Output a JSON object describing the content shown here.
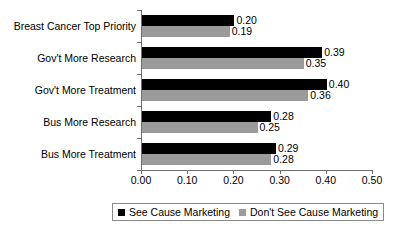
{
  "chart_data": {
    "type": "bar",
    "orientation": "horizontal",
    "title": "",
    "xlabel": "",
    "ylabel": "",
    "xlim": [
      0.0,
      0.5
    ],
    "xticks": [
      "0.00",
      "0.10",
      "0.20",
      "0.30",
      "0.40",
      "0.50"
    ],
    "xtick_values": [
      0.0,
      0.1,
      0.2,
      0.3,
      0.4,
      0.5
    ],
    "grid": false,
    "legend_position": "bottom",
    "categories": [
      "Breast Cancer Top Priority",
      "Gov't More Research",
      "Gov't More Treatment",
      "Bus More Research",
      "Bus More Treatment"
    ],
    "series": [
      {
        "name": "See Cause Marketing",
        "color": "#000000",
        "values": [
          0.2,
          0.39,
          0.4,
          0.28,
          0.29
        ],
        "labels": [
          "0.20",
          "0.39",
          "0.40",
          "0.28",
          "0.29"
        ]
      },
      {
        "name": "Don't See Cause Marketing",
        "color": "#9b9b9b",
        "values": [
          0.19,
          0.35,
          0.36,
          0.25,
          0.28
        ],
        "labels": [
          "0.19",
          "0.35",
          "0.36",
          "0.25",
          "0.28"
        ]
      }
    ]
  }
}
